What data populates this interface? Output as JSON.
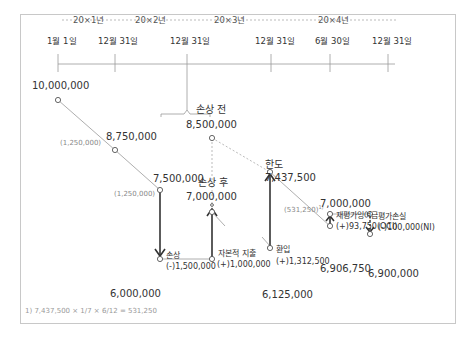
{
  "timeline": {
    "years": [
      "20×1년",
      "20×2년",
      "20×3년",
      "20×4년"
    ],
    "dates": [
      "1월 1일",
      "12월 31일",
      "12월 31일",
      "12월 31일",
      "6월 30일",
      "12월 31일"
    ]
  },
  "points": {
    "start": "10,000,000",
    "y1_end": "8,750,000",
    "y2_end": "7,500,000",
    "before_impairment_label": "손상 전",
    "before_impairment": "8,500,000",
    "after_impairment_label": "손상 후",
    "after_impairment": "7,000,000",
    "impaired": "6,000,000",
    "limit_label": "한도",
    "limit": "7,437,500",
    "reversal_base": "6,125,000",
    "revalued": "7,000,000",
    "mid_y4": "6,906,750",
    "end_y4": "6,900,000"
  },
  "annotations": {
    "dep_y1": "(1,250,000)",
    "dep_y2": "(1,250,000)",
    "dep_y4": "(531,250)",
    "dep_y4_note": "1)",
    "impairment_label": "손상",
    "impairment_amount": "(-)1,500,000",
    "capex_label": "자본적 지출",
    "capex_amount": "(+)1,000,000",
    "reversal_label": "환입",
    "reversal_amount": "(+)1,312,500",
    "reval_surplus_label": "재평가잉여금",
    "reval_surplus_amount": "(+)93,750(OCI)",
    "reval_loss_label": "평가손실",
    "reval_loss_amount": "(-)100,000(NI)"
  },
  "footnote": "1) 7,437,500 × 1/7 × 6/12 = 531,250"
}
